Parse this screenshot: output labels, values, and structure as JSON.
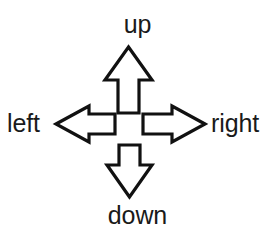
{
  "diagram": {
    "type": "four-direction-arrow-cross",
    "background_color": "#ffffff",
    "stroke_color": "#111111",
    "fill_color": "#ffffff",
    "text_color": "#1a1a1a",
    "arrows": [
      {
        "id": "up",
        "icon": "arrow-up-outline-icon",
        "points_toward": "top"
      },
      {
        "id": "left",
        "icon": "arrow-left-outline-icon",
        "points_toward": "left"
      },
      {
        "id": "right",
        "icon": "arrow-right-outline-icon",
        "points_toward": "right"
      },
      {
        "id": "down",
        "icon": "arrow-down-outline-icon",
        "points_toward": "bottom"
      }
    ],
    "labels": {
      "up": "up",
      "left": "left",
      "right": "right",
      "down": "down"
    }
  }
}
